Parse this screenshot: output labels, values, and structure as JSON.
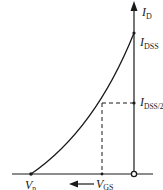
{
  "diagram": {
    "type": "jfet-transfer-characteristic",
    "colors": {
      "line": "#1a1a1a",
      "background": "#ffffff"
    },
    "axes": {
      "y_label": {
        "main": "I",
        "sub": "D"
      },
      "x_label": {
        "main": "V",
        "sub": "GS"
      }
    },
    "points": {
      "idss": {
        "main": "I",
        "sub": "DSS"
      },
      "idss_half": {
        "main": "I",
        "sub": "DSS/2"
      },
      "vp": {
        "main": "V",
        "sub": "p"
      }
    }
  }
}
